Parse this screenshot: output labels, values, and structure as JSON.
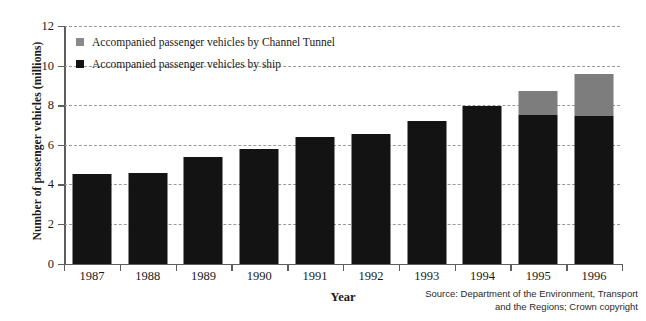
{
  "chart_data": {
    "type": "bar",
    "stacked": true,
    "title": "",
    "xlabel": "Year",
    "ylabel": "Number of passenger vehicles (millions)",
    "ylim": [
      0,
      12
    ],
    "ytick_step": 2,
    "yticks": [
      12,
      10,
      8,
      6,
      4,
      2,
      0
    ],
    "grid": "horizontal-dashed",
    "legend_position": "inside-top-left",
    "categories": [
      "1987",
      "1988",
      "1989",
      "1990",
      "1991",
      "1992",
      "1993",
      "1994",
      "1995",
      "1996"
    ],
    "series": [
      {
        "name": "Accompanied passenger vehicles by ship",
        "color": "#131313",
        "values": [
          4.5,
          4.55,
          5.4,
          5.8,
          6.4,
          6.55,
          7.2,
          7.95,
          7.5,
          7.45
        ]
      },
      {
        "name": "Accompanied passenger vehicles by Channel Tunnel",
        "color": "#7d7d7d",
        "values": [
          0,
          0,
          0,
          0,
          0,
          0,
          0,
          0,
          1.2,
          2.15
        ]
      }
    ],
    "totals": [
      4.5,
      4.55,
      5.4,
      5.8,
      6.4,
      6.55,
      7.2,
      7.95,
      8.7,
      9.6
    ]
  },
  "legend": {
    "items": [
      {
        "label": "Accompanied passenger vehicles by Channel Tunnel",
        "swatch": "tunnel-swatch"
      },
      {
        "label": "Accompanied passenger vehicles by ship",
        "swatch": "ship-swatch"
      }
    ]
  },
  "source": {
    "line1": "Source: Department of the Environment, Transport",
    "line2": "and the Regions; Crown copyright"
  },
  "colors": {
    "ship": "#131313",
    "tunnel": "#7d7d7d",
    "axis": "#5e5e5e",
    "grid": "#9a9a9a",
    "background": "#ffffff"
  }
}
